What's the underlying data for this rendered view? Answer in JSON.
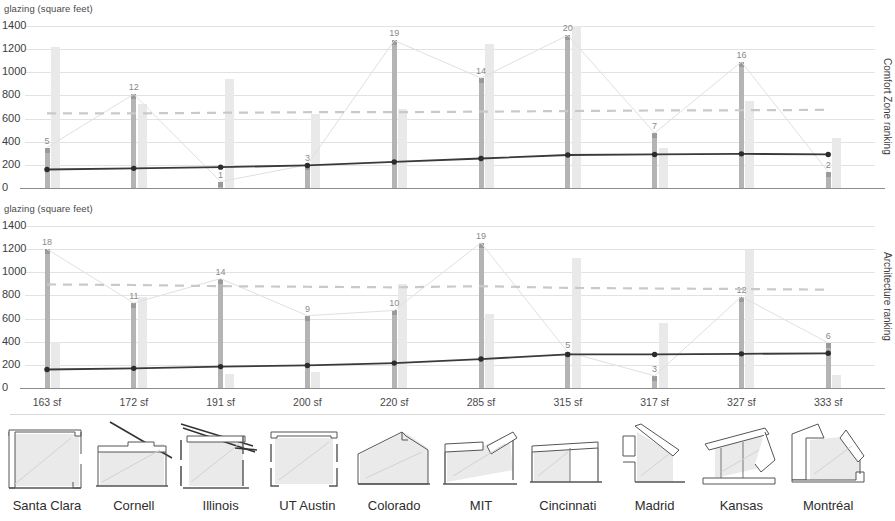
{
  "chart_data": [
    {
      "type": "bar",
      "title": "",
      "ylabel": "glazing (square feet)",
      "right_axis_label": "Comfort Zone ranking",
      "ylim": [
        0,
        1400
      ],
      "yticks": [
        0,
        200,
        400,
        600,
        800,
        1000,
        1200,
        1400
      ],
      "grid": true,
      "categories": [
        "Santa Clara",
        "Cornell",
        "Illinois",
        "UT Austin",
        "Colorado",
        "MIT",
        "Cincinnati",
        "Madrid",
        "Kansas",
        "Montréal"
      ],
      "series": [
        {
          "name": "Comfort Zone ranking (scaled)",
          "values": [
            350,
            810,
            55,
            200,
            1275,
            950,
            1320,
            475,
            1090,
            140
          ]
        },
        {
          "name": "glazing (square feet)",
          "values": [
            1215,
            730,
            940,
            640,
            680,
            1245,
            1400,
            345,
            755,
            435
          ]
        },
        {
          "name": "dark trend line",
          "values": [
            160,
            170,
            180,
            195,
            225,
            255,
            285,
            290,
            295,
            290
          ]
        },
        {
          "name": "dashed reference line",
          "values": [
            645,
            645,
            650,
            655,
            655,
            660,
            665,
            670,
            672,
            675
          ]
        }
      ],
      "point_labels": [
        "5",
        "12",
        "1",
        "3",
        "19",
        "14",
        "20",
        "7",
        "16",
        "2"
      ]
    },
    {
      "type": "bar",
      "title": "",
      "ylabel": "glazing (square feet)",
      "right_axis_label": "Architecture ranking",
      "ylim": [
        0,
        1400
      ],
      "yticks": [
        0,
        200,
        400,
        600,
        800,
        1000,
        1200,
        1400
      ],
      "grid": true,
      "categories": [
        "Santa Clara",
        "Cornell",
        "Illinois",
        "UT Austin",
        "Colorado",
        "MIT",
        "Cincinnati",
        "Madrid",
        "Kansas",
        "Montréal"
      ],
      "series": [
        {
          "name": "Architecture ranking (scaled)",
          "values": [
            1200,
            735,
            945,
            625,
            670,
            1255,
            310,
            105,
            790,
            390
          ]
        },
        {
          "name": "glazing (square feet)",
          "values": [
            400,
            790,
            120,
            140,
            900,
            640,
            1120,
            560,
            1190,
            115
          ]
        },
        {
          "name": "dark trend line",
          "values": [
            160,
            170,
            185,
            195,
            215,
            250,
            290,
            290,
            295,
            300
          ]
        },
        {
          "name": "dashed reference line",
          "values": [
            895,
            890,
            880,
            875,
            870,
            880,
            865,
            860,
            855,
            850
          ]
        }
      ],
      "point_labels": [
        "18",
        "11",
        "14",
        "9",
        "10",
        "19",
        "5",
        "3",
        "12",
        "6"
      ]
    }
  ],
  "chart_top": {
    "y_axis_label": "glazing (square feet)",
    "right_axis_label": "Comfort Zone ranking",
    "yticks": [
      "1400",
      "1200",
      "1000",
      "800",
      "600",
      "400",
      "200",
      "0"
    ]
  },
  "chart_bottom": {
    "y_axis_label": "glazing (square feet)",
    "right_axis_label": "Architecture ranking",
    "yticks": [
      "1400",
      "1200",
      "1000",
      "800",
      "600",
      "400",
      "200",
      "0"
    ]
  },
  "footer": {
    "entries": [
      {
        "area": "163 sf",
        "school": "Santa Clara",
        "icon": "section-santa-clara"
      },
      {
        "area": "172 sf",
        "school": "Cornell",
        "icon": "section-cornell"
      },
      {
        "area": "191 sf",
        "school": "Illinois",
        "icon": "section-illinois"
      },
      {
        "area": "200 sf",
        "school": "UT Austin",
        "icon": "section-ut-austin"
      },
      {
        "area": "220 sf",
        "school": "Colorado",
        "icon": "section-colorado"
      },
      {
        "area": "285 sf",
        "school": "MIT",
        "icon": "section-mit"
      },
      {
        "area": "315 sf",
        "school": "Cincinnati",
        "icon": "section-cincinnati"
      },
      {
        "area": "317 sf",
        "school": "Madrid",
        "icon": "section-madrid"
      },
      {
        "area": "327 sf",
        "school": "Kansas",
        "icon": "section-kansas"
      },
      {
        "area": "333 sf",
        "school": "Montréal",
        "icon": "section-montreal"
      }
    ]
  },
  "colors": {
    "glazing_bar": "#e9e9e9",
    "rank_bar": "#b4b4b4",
    "trend_line": "#3a3a3a",
    "dashed_line": "#c9c9c9",
    "grid": "#e2e2e2",
    "axis": "#8d8d8d"
  }
}
